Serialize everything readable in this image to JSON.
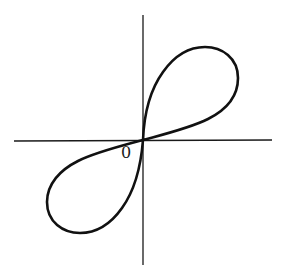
{
  "figure": {
    "type": "polar-curve-diagram",
    "origin_label": "0",
    "axes": {
      "x_axis": {
        "from": [
          14,
          141
        ],
        "to": [
          272,
          140
        ]
      },
      "y_axis": {
        "from": [
          143,
          15
        ],
        "to": [
          143,
          265
        ]
      }
    },
    "colors": {
      "background": "#ffffff",
      "ink": "#111111"
    },
    "lobes": [
      {
        "name": "upper-right-lobe",
        "quadrant": "I"
      },
      {
        "name": "lower-left-lobe",
        "quadrant": "III"
      }
    ]
  }
}
